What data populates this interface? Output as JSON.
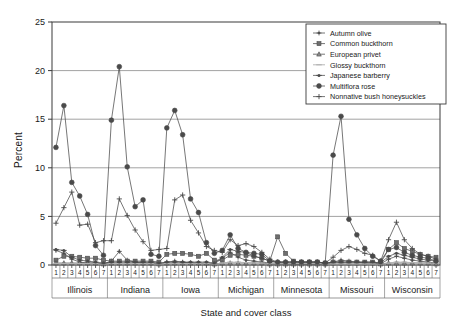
{
  "chart_data": {
    "type": "line",
    "title": "",
    "xlabel": "State and cover class",
    "ylabel": "Percent",
    "ylim": [
      0,
      25
    ],
    "yticks": [
      0,
      5,
      10,
      15,
      20,
      25
    ],
    "grid": "horizontal",
    "legend_position": "top-right",
    "groups": [
      "Illinois",
      "Indiana",
      "Iowa",
      "Michigan",
      "Minnesota",
      "Missouri",
      "Wisconsin"
    ],
    "cover_classes": [
      "1",
      "2",
      "3",
      "4",
      "5",
      "6",
      "7"
    ],
    "categories": [
      "Illinois 1",
      "Illinois 2",
      "Illinois 3",
      "Illinois 4",
      "Illinois 5",
      "Illinois 6",
      "Illinois 7",
      "Indiana 1",
      "Indiana 2",
      "Indiana 3",
      "Indiana 4",
      "Indiana 5",
      "Indiana 6",
      "Indiana 7",
      "Iowa 1",
      "Iowa 2",
      "Iowa 3",
      "Iowa 4",
      "Iowa 5",
      "Iowa 6",
      "Iowa 7",
      "Michigan 1",
      "Michigan 2",
      "Michigan 3",
      "Michigan 4",
      "Michigan 5",
      "Michigan 6",
      "Michigan 7",
      "Minnesota 1",
      "Minnesota 2",
      "Minnesota 3",
      "Minnesota 4",
      "Minnesota 5",
      "Minnesota 6",
      "Minnesota 7",
      "Missouri 1",
      "Missouri 2",
      "Missouri 3",
      "Missouri 4",
      "Missouri 5",
      "Missouri 6",
      "Missouri 7",
      "Wisconsin 1",
      "Wisconsin 2",
      "Wisconsin 3",
      "Wisconsin 4",
      "Wisconsin 5",
      "Wisconsin 6",
      "Wisconsin 7"
    ],
    "series": [
      {
        "name": "Autumn olive",
        "marker": "plus-dot",
        "values": [
          1.5,
          1.2,
          0.6,
          0.3,
          0.2,
          0.2,
          0.1,
          0.4,
          1.4,
          0.5,
          0.3,
          0.2,
          0.2,
          0.1,
          0.3,
          0.4,
          0.3,
          0.2,
          0.2,
          0.1,
          0.1,
          0.7,
          1.3,
          0.8,
          0.5,
          0.4,
          0.3,
          0.2,
          0.2,
          0.2,
          0.1,
          0.1,
          0.1,
          0.1,
          0.1,
          0.3,
          0.5,
          0.4,
          0.3,
          0.2,
          0.2,
          0.1,
          0.6,
          0.9,
          0.7,
          0.5,
          0.4,
          0.3,
          0.2
        ]
      },
      {
        "name": "Common buckthorn",
        "marker": "square",
        "values": [
          0.5,
          0.9,
          0.9,
          0.8,
          0.7,
          0.7,
          0.5,
          0.4,
          0.4,
          0.4,
          0.4,
          0.4,
          0.4,
          0.3,
          1.1,
          1.2,
          1.2,
          1.1,
          0.9,
          1.2,
          0.5,
          0.5,
          1.0,
          1.1,
          1.0,
          0.9,
          0.7,
          0.4,
          2.9,
          1.2,
          0.4,
          0.3,
          0.3,
          0.3,
          0.2,
          0.3,
          0.3,
          0.3,
          0.3,
          0.3,
          0.3,
          0.2,
          1.6,
          2.3,
          1.7,
          1.4,
          1.1,
          0.9,
          0.8
        ]
      },
      {
        "name": "European privet",
        "marker": "triangle",
        "values": [
          0.2,
          0.2,
          0.2,
          0.2,
          0.2,
          0.2,
          0.1,
          0.2,
          0.2,
          0.2,
          0.2,
          0.2,
          0.2,
          0.1,
          0.2,
          0.2,
          0.2,
          0.2,
          0.2,
          0.2,
          0.1,
          0.2,
          0.2,
          0.2,
          0.2,
          0.2,
          0.2,
          0.1,
          0.1,
          0.1,
          0.1,
          0.1,
          0.1,
          0.1,
          0.1,
          0.2,
          0.2,
          0.2,
          0.2,
          0.2,
          0.2,
          0.1,
          0.2,
          0.2,
          0.2,
          0.2,
          0.2,
          0.2,
          0.1
        ]
      },
      {
        "name": "Glossy buckthorn",
        "marker": "line",
        "values": [
          0.15,
          0.15,
          0.15,
          0.15,
          0.15,
          0.15,
          0.1,
          0.15,
          0.15,
          0.15,
          0.15,
          0.15,
          0.15,
          0.1,
          0.15,
          0.15,
          0.15,
          0.15,
          0.15,
          0.15,
          0.1,
          0.2,
          0.3,
          0.3,
          0.25,
          0.2,
          0.2,
          0.15,
          0.15,
          0.15,
          0.15,
          0.15,
          0.15,
          0.15,
          0.1,
          0.1,
          0.1,
          0.1,
          0.1,
          0.1,
          0.1,
          0.1,
          0.2,
          0.3,
          0.3,
          0.25,
          0.2,
          0.2,
          0.15
        ]
      },
      {
        "name": "Japanese barberry",
        "marker": "dash-dot",
        "values": [
          1.6,
          1.5,
          0.8,
          0.5,
          0.4,
          0.3,
          0.2,
          0.3,
          0.3,
          0.3,
          0.3,
          0.3,
          0.3,
          0.2,
          0.3,
          0.3,
          0.3,
          0.3,
          0.3,
          0.3,
          0.2,
          0.8,
          1.6,
          1.4,
          1.3,
          0.9,
          0.7,
          0.4,
          0.3,
          0.3,
          0.3,
          0.3,
          0.3,
          0.3,
          0.2,
          0.3,
          0.3,
          0.3,
          0.3,
          0.3,
          0.3,
          0.2,
          0.9,
          1.2,
          1.0,
          0.8,
          0.6,
          0.5,
          0.4
        ]
      },
      {
        "name": "Multiflora rose",
        "marker": "filled-circle",
        "values": [
          12.1,
          16.4,
          8.5,
          7.1,
          5.2,
          2.0,
          1.0,
          14.9,
          20.4,
          10.1,
          6.0,
          6.7,
          1.1,
          0.9,
          14.1,
          15.9,
          13.4,
          6.8,
          5.4,
          2.3,
          1.2,
          1.5,
          3.1,
          1.7,
          1.3,
          1.2,
          1.1,
          0.4,
          0.3,
          0.3,
          0.3,
          0.3,
          0.3,
          0.3,
          0.2,
          11.3,
          15.3,
          4.7,
          3.1,
          1.7,
          0.9,
          0.4,
          1.6,
          1.8,
          1.3,
          1.0,
          0.8,
          0.7,
          0.4
        ]
      },
      {
        "name": "Nonnative bush honeysuckles",
        "marker": "plus",
        "values": [
          4.3,
          5.9,
          7.5,
          4.1,
          4.2,
          2.3,
          2.5,
          2.5,
          6.8,
          5.1,
          3.6,
          2.4,
          1.5,
          1.6,
          1.7,
          6.7,
          7.2,
          4.6,
          3.3,
          1.9,
          1.5,
          1.3,
          2.6,
          2.0,
          2.2,
          1.9,
          1.3,
          0.6,
          0.3,
          0.3,
          0.3,
          0.3,
          0.3,
          0.3,
          0.2,
          0.8,
          1.5,
          1.9,
          1.6,
          1.2,
          1.0,
          0.4,
          2.6,
          4.4,
          2.6,
          1.7,
          1.1,
          0.9,
          0.6
        ]
      }
    ]
  },
  "colors": {
    "axis": "#3a3a3a",
    "grid": "#8a8a8a",
    "series": "#4a4a4a",
    "text": "#1a1a1a",
    "background": "#ffffff"
  }
}
